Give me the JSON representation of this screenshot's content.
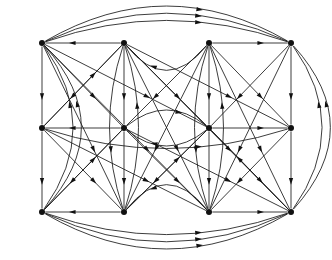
{
  "figure": {
    "title": "",
    "type": "directed-graph",
    "background_color": "#ffffff",
    "stroke_color": "#1a1a1a",
    "node_color": "#111111",
    "node_radius": 3.0,
    "edge_width": 0.85,
    "arrow_size": 4.4,
    "width": 332,
    "height": 260
  },
  "graph_data": {
    "type": "digraph",
    "directed": true,
    "node_count": 12,
    "edge_count": 60,
    "layout": "grid-4x3",
    "nodes": [
      {
        "id": "n0",
        "label": "",
        "row": 0,
        "col": 0,
        "x": 42,
        "y": 43
      },
      {
        "id": "n1",
        "label": "",
        "row": 0,
        "col": 1,
        "x": 124,
        "y": 43
      },
      {
        "id": "n2",
        "label": "",
        "row": 0,
        "col": 2,
        "x": 209,
        "y": 43
      },
      {
        "id": "n3",
        "label": "",
        "row": 0,
        "col": 3,
        "x": 291,
        "y": 43
      },
      {
        "id": "n4",
        "label": "",
        "row": 1,
        "col": 0,
        "x": 42,
        "y": 128
      },
      {
        "id": "n5",
        "label": "",
        "row": 1,
        "col": 1,
        "x": 124,
        "y": 128
      },
      {
        "id": "n6",
        "label": "",
        "row": 1,
        "col": 2,
        "x": 209,
        "y": 128
      },
      {
        "id": "n7",
        "label": "",
        "row": 1,
        "col": 3,
        "x": 291,
        "y": 128
      },
      {
        "id": "n8",
        "label": "",
        "row": 2,
        "col": 0,
        "x": 42,
        "y": 212
      },
      {
        "id": "n9",
        "label": "",
        "row": 2,
        "col": 1,
        "x": 124,
        "y": 212
      },
      {
        "id": "n10",
        "label": "",
        "row": 2,
        "col": 2,
        "x": 209,
        "y": 212
      },
      {
        "id": "n11",
        "label": "",
        "row": 2,
        "col": 3,
        "x": 291,
        "y": 212
      }
    ],
    "edges": [
      {
        "from": "n1",
        "to": "n0",
        "shape": "line",
        "bow": 0
      },
      {
        "from": "n2",
        "to": "n1",
        "shape": "arc",
        "bow": -26
      },
      {
        "from": "n2",
        "to": "n3",
        "shape": "line",
        "bow": 0
      },
      {
        "from": "n0",
        "to": "n3",
        "shape": "arc",
        "bow": -22
      },
      {
        "from": "n0",
        "to": "n3",
        "shape": "arc",
        "bow": -29
      },
      {
        "from": "n0",
        "to": "n3",
        "shape": "arc",
        "bow": -36
      },
      {
        "from": "n5",
        "to": "n4",
        "shape": "line",
        "bow": 0
      },
      {
        "from": "n6",
        "to": "n5",
        "shape": "arc",
        "bow": -17
      },
      {
        "from": "n5",
        "to": "n6",
        "shape": "arc",
        "bow": -17
      },
      {
        "from": "n6",
        "to": "n7",
        "shape": "line",
        "bow": 0
      },
      {
        "from": "n4",
        "to": "n7",
        "shape": "arc",
        "bow": 20
      },
      {
        "from": "n9",
        "to": "n8",
        "shape": "line",
        "bow": 0
      },
      {
        "from": "n10",
        "to": "n9",
        "shape": "arc",
        "bow": 26
      },
      {
        "from": "n10",
        "to": "n11",
        "shape": "line",
        "bow": 0
      },
      {
        "from": "n8",
        "to": "n11",
        "shape": "arc",
        "bow": 22
      },
      {
        "from": "n8",
        "to": "n11",
        "shape": "arc",
        "bow": 29
      },
      {
        "from": "n8",
        "to": "n11",
        "shape": "arc",
        "bow": 36
      },
      {
        "from": "n0",
        "to": "n4",
        "shape": "line",
        "bow": 0
      },
      {
        "from": "n4",
        "to": "n8",
        "shape": "line",
        "bow": 0
      },
      {
        "from": "n8",
        "to": "n0",
        "shape": "arc",
        "bow": 30
      },
      {
        "from": "n8",
        "to": "n0",
        "shape": "arc",
        "bow": 38
      },
      {
        "from": "n1",
        "to": "n5",
        "shape": "line",
        "bow": 0
      },
      {
        "from": "n5",
        "to": "n9",
        "shape": "line",
        "bow": 0
      },
      {
        "from": "n1",
        "to": "n9",
        "shape": "arc",
        "bow": 14
      },
      {
        "from": "n9",
        "to": "n1",
        "shape": "arc",
        "bow": 14
      },
      {
        "from": "n2",
        "to": "n6",
        "shape": "line",
        "bow": 0
      },
      {
        "from": "n6",
        "to": "n10",
        "shape": "line",
        "bow": 0
      },
      {
        "from": "n2",
        "to": "n10",
        "shape": "arc",
        "bow": 14
      },
      {
        "from": "n10",
        "to": "n2",
        "shape": "arc",
        "bow": 14
      },
      {
        "from": "n3",
        "to": "n7",
        "shape": "line",
        "bow": 0
      },
      {
        "from": "n7",
        "to": "n11",
        "shape": "line",
        "bow": 0
      },
      {
        "from": "n11",
        "to": "n3",
        "shape": "arc",
        "bow": 30
      },
      {
        "from": "n11",
        "to": "n3",
        "shape": "arc",
        "bow": 38
      },
      {
        "from": "n0",
        "to": "n5",
        "shape": "line",
        "bow": 0
      },
      {
        "from": "n0",
        "to": "n6",
        "shape": "line",
        "bow": 0
      },
      {
        "from": "n0",
        "to": "n9",
        "shape": "line",
        "bow": 0
      },
      {
        "from": "n0",
        "to": "n10",
        "shape": "line",
        "bow": 0
      },
      {
        "from": "n1",
        "to": "n4",
        "shape": "line",
        "bow": 0
      },
      {
        "from": "n1",
        "to": "n6",
        "shape": "line",
        "bow": 0
      },
      {
        "from": "n1",
        "to": "n7",
        "shape": "line",
        "bow": 0
      },
      {
        "from": "n1",
        "to": "n10",
        "shape": "line",
        "bow": 0
      },
      {
        "from": "n1",
        "to": "n11",
        "shape": "line",
        "bow": 0
      },
      {
        "from": "n2",
        "to": "n5",
        "shape": "line",
        "bow": 0
      },
      {
        "from": "n2",
        "to": "n7",
        "shape": "line",
        "bow": 0
      },
      {
        "from": "n2",
        "to": "n9",
        "shape": "line",
        "bow": 0
      },
      {
        "from": "n2",
        "to": "n11",
        "shape": "line",
        "bow": 0
      },
      {
        "from": "n3",
        "to": "n6",
        "shape": "line",
        "bow": 0
      },
      {
        "from": "n3",
        "to": "n10",
        "shape": "line",
        "bow": 0
      },
      {
        "from": "n4",
        "to": "n9",
        "shape": "line",
        "bow": 0
      },
      {
        "from": "n4",
        "to": "n10",
        "shape": "line",
        "bow": 0
      },
      {
        "from": "n5",
        "to": "n8",
        "shape": "line",
        "bow": 0
      },
      {
        "from": "n5",
        "to": "n10",
        "shape": "line",
        "bow": 0
      },
      {
        "from": "n5",
        "to": "n11",
        "shape": "line",
        "bow": 0
      },
      {
        "from": "n6",
        "to": "n9",
        "shape": "line",
        "bow": 0
      },
      {
        "from": "n6",
        "to": "n11",
        "shape": "line",
        "bow": 0
      },
      {
        "from": "n7",
        "to": "n10",
        "shape": "line",
        "bow": 0
      },
      {
        "from": "n4",
        "to": "n1",
        "shape": "line",
        "bow": 0
      },
      {
        "from": "n9",
        "to": "n6",
        "shape": "line",
        "bow": 0
      },
      {
        "from": "n8",
        "to": "n5",
        "shape": "line",
        "bow": 0
      },
      {
        "from": "n11",
        "to": "n6",
        "shape": "line",
        "bow": 0
      }
    ]
  }
}
